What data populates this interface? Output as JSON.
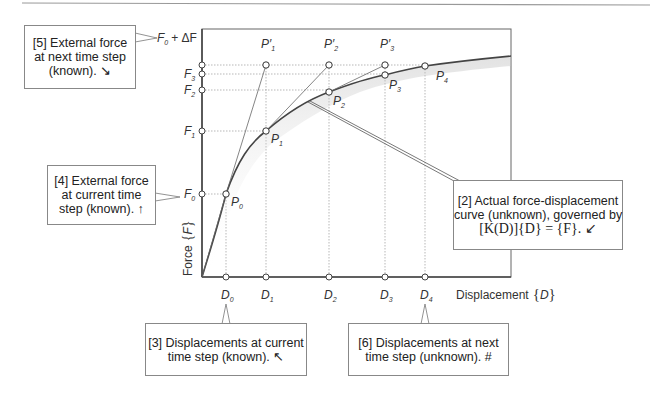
{
  "diagram": {
    "axes": {
      "y_label": "Force",
      "y_symbol": "F",
      "x_label": "Displacement",
      "x_symbol": "D"
    },
    "force_levels": [
      {
        "label": "F",
        "sub": "0",
        "suffix": "+ ΔF",
        "y": 65
      },
      {
        "label": "F",
        "sub": "3",
        "suffix": "",
        "y": 74
      },
      {
        "label": "F",
        "sub": "2",
        "suffix": "",
        "y": 90
      },
      {
        "label": "F",
        "sub": "1",
        "suffix": "",
        "y": 131
      },
      {
        "label": "F",
        "sub": "0",
        "suffix": "",
        "y": 194
      }
    ],
    "displacements": [
      {
        "label": "D",
        "sub": "0",
        "x": 226
      },
      {
        "label": "D",
        "sub": "1",
        "x": 266
      },
      {
        "label": "D",
        "sub": "2",
        "x": 329
      },
      {
        "label": "D",
        "sub": "3",
        "x": 385
      },
      {
        "label": "D",
        "sub": "4",
        "x": 425
      }
    ],
    "curve_points": [
      {
        "label": "P",
        "sub": "0",
        "x": 226,
        "y": 194
      },
      {
        "label": "P",
        "sub": "1",
        "x": 266,
        "y": 131
      },
      {
        "label": "P",
        "sub": "2",
        "x": 329,
        "y": 92
      },
      {
        "label": "P",
        "sub": "3",
        "x": 385,
        "y": 75
      },
      {
        "label": "P",
        "sub": "4",
        "x": 425,
        "y": 66
      }
    ],
    "predictor_points": [
      {
        "label": "P′",
        "sub": "1",
        "x": 266,
        "y": 65
      },
      {
        "label": "P′",
        "sub": "2",
        "x": 329,
        "y": 65
      },
      {
        "label": "P′",
        "sub": "3",
        "x": 385,
        "y": 65
      }
    ]
  },
  "callouts": {
    "c5": {
      "lines": [
        "[5] External force",
        "at next time step",
        "(known). ↘"
      ]
    },
    "c4": {
      "lines": [
        "[4] External force",
        "at current time",
        "step (known). ↑"
      ]
    },
    "c2": {
      "lines": [
        "[2] Actual force-displacement",
        "curve (unknown), governed by",
        "[K(D)]{D} = {F}. ↙"
      ]
    },
    "c3": {
      "lines": [
        "[3] Displacements at current",
        "time step (known). ↖"
      ]
    },
    "c6": {
      "lines": [
        "[6] Displacements at next",
        "time step (unknown). #"
      ]
    }
  }
}
